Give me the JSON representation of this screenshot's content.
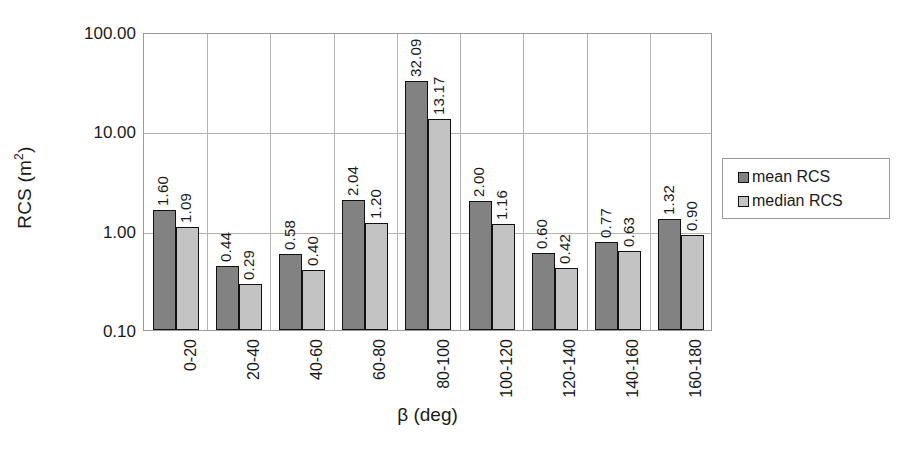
{
  "chart_data": {
    "type": "bar",
    "title": "",
    "xlabel": "β (deg)",
    "ylabel": "RCS (m²)",
    "ylabel_base": "RCS (m",
    "ylabel_sup": "2",
    "ylabel_tail": ")",
    "yscale": "log",
    "ylim": [
      0.1,
      100.0
    ],
    "ytick_labels": [
      "100.00",
      "10.00",
      "1.00",
      "0.10"
    ],
    "ytick_values": [
      100.0,
      10.0,
      1.0,
      0.1
    ],
    "grid": "horizontal-and-vertical",
    "legend_position": "right",
    "categories": [
      "0-20",
      "20-40",
      "40-60",
      "60-80",
      "80-100",
      "100-120",
      "120-140",
      "140-160",
      "160-180"
    ],
    "series": [
      {
        "name": "mean RCS",
        "color": "#828282",
        "values": [
          1.6,
          0.44,
          0.58,
          2.04,
          32.09,
          2.0,
          0.6,
          0.77,
          1.32
        ],
        "labels": [
          "1.60",
          "0.44",
          "0.58",
          "2.04",
          "32.09",
          "2.00",
          "0.60",
          "0.77",
          "1.32"
        ]
      },
      {
        "name": "median RCS",
        "color": "#c3c3c3",
        "values": [
          1.09,
          0.29,
          0.4,
          1.2,
          13.17,
          1.16,
          0.42,
          0.63,
          0.9
        ],
        "labels": [
          "1.09",
          "0.29",
          "0.40",
          "1.20",
          "13.17",
          "1.16",
          "0.42",
          "0.63",
          "0.90"
        ]
      }
    ]
  },
  "legend": {
    "items": [
      {
        "label": "mean RCS",
        "swatch": "mean"
      },
      {
        "label": "median RCS",
        "swatch": "median"
      }
    ]
  }
}
